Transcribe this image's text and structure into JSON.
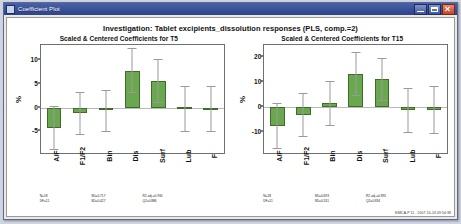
{
  "window": {
    "title": "Coefficient Plot",
    "controls": {
      "minimize_label": "Minimize",
      "maximize_label": "Maximize",
      "close_label": "Close"
    }
  },
  "main_title": "Investigation: Tablet excipients_dissolution responses (PLS, comp.=2)",
  "footer": "SIMCA-P 11 - 2007-10-24 09:54:38",
  "panels": [
    {
      "title": "Scaled & Centered Coefficients for T5",
      "ylabel": "%",
      "stats": {
        "n": "N=18",
        "df": "DF=11",
        "sd": "SD=0.717",
        "sd2": "SD=0.427",
        "r2": "R2 adj.=0.930",
        "q2": "Q2=0.886"
      }
    },
    {
      "title": "Scaled & Centered Coefficients for T15",
      "ylabel": "%",
      "stats": {
        "n": "N=18",
        "df": "DF=11",
        "sd": "SD=0.693",
        "sd2": "SD=0.531",
        "r2": "R2 adj.=0.895",
        "q2": "Q2=0.834"
      }
    }
  ],
  "chart_data": [
    {
      "type": "bar",
      "title": "Scaled & Centered Coefficients for T5",
      "xlabel": "",
      "ylabel": "%",
      "categories": [
        "A/F",
        "F1/F2",
        "Bin",
        "Dis",
        "Surf",
        "Lub",
        "F"
      ],
      "values": [
        -4.3,
        -1.1,
        -0.6,
        7.7,
        5.7,
        0.1,
        -0.1
      ],
      "error_low": [
        -8.8,
        -5.5,
        -5.0,
        3.3,
        1.2,
        -5.0,
        -5.0
      ],
      "error_high": [
        0.4,
        3.2,
        3.7,
        12.5,
        10.3,
        4.6,
        4.6
      ],
      "yticks": [
        10,
        5,
        0,
        -5
      ],
      "ylim": [
        -9.6,
        13.2
      ],
      "grid": false,
      "legend": false,
      "bar_color": "#6aa84f",
      "error_color": "#9a9a9a"
    },
    {
      "type": "bar",
      "title": "Scaled & Centered Coefficients for T15",
      "xlabel": "",
      "ylabel": "%",
      "categories": [
        "A/F",
        "F1/F2",
        "Bin",
        "Dis",
        "Surf",
        "Lub",
        "F"
      ],
      "values": [
        -7.5,
        -3.0,
        1.7,
        13.5,
        11.2,
        -1.2,
        -1.0
      ],
      "error_low": [
        -16.5,
        -11.5,
        -7.3,
        5.0,
        2.8,
        -10.2,
        -10.3
      ],
      "error_high": [
        1.5,
        5.5,
        10.7,
        22.0,
        19.6,
        7.8,
        8.3
      ],
      "yticks": [
        20,
        10,
        0,
        -10
      ],
      "ylim": [
        -18.5,
        25.0
      ],
      "grid": false,
      "legend": false,
      "bar_color": "#6aa84f",
      "error_color": "#9a9a9a"
    }
  ]
}
